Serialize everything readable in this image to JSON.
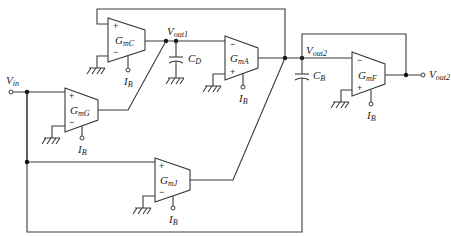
{
  "diagram": {
    "type": "circuit-schematic",
    "amplifiers": [
      {
        "id": "GmC",
        "label_main": "G",
        "label_sub": "mC",
        "plus": "+",
        "minus": "−",
        "bias": {
          "main": "I",
          "sub": "B"
        }
      },
      {
        "id": "GmA",
        "label_main": "G",
        "label_sub": "mA",
        "plus": "+",
        "minus": "−",
        "bias": {
          "main": "I",
          "sub": "B"
        }
      },
      {
        "id": "GmF",
        "label_main": "G",
        "label_sub": "mF",
        "plus": "+",
        "minus": "−",
        "bias": {
          "main": "I",
          "sub": "B"
        }
      },
      {
        "id": "GmG",
        "label_main": "G",
        "label_sub": "mG",
        "plus": "+",
        "minus": "−",
        "bias": {
          "main": "I",
          "sub": "B"
        }
      },
      {
        "id": "GmJ",
        "label_main": "G",
        "label_sub": "mJ",
        "plus": "+",
        "minus": "−",
        "bias": {
          "main": "I",
          "sub": "B"
        }
      }
    ],
    "capacitors": [
      {
        "id": "CD",
        "main": "C",
        "sub": "D"
      },
      {
        "id": "CB",
        "main": "C",
        "sub": "B"
      }
    ],
    "nodes": {
      "vin": {
        "main": "V",
        "sub": "in"
      },
      "vout1": {
        "main": "V",
        "sub": "out1"
      },
      "vout2": {
        "main": "V",
        "sub": "out2"
      },
      "vout2_terminal": {
        "main": "V",
        "sub": "out2"
      }
    }
  }
}
